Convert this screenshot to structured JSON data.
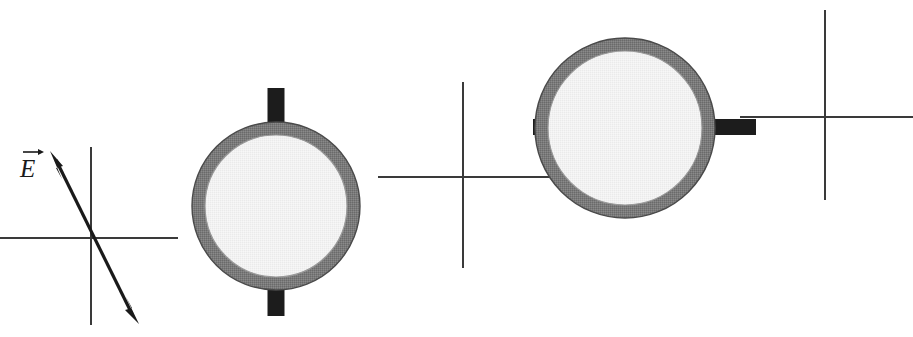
{
  "figure": {
    "width": 913,
    "height": 337,
    "background_color": "#ffffff"
  },
  "colors": {
    "axis_stroke": "#3a3a3a",
    "vector_stroke": "#1a1a1a",
    "ring_annulus": "#767676",
    "ring_inner_fill": "#f0f0f0",
    "tab_fill": "#1c1c1c",
    "label_color": "#1a1a1a"
  },
  "labels": {
    "e_field": "E",
    "e_field_full": "E vector"
  },
  "axes": [
    {
      "name": "left-axes",
      "origin_x": 91,
      "origin_y": 238,
      "x_start": 0,
      "x_end": 178,
      "y_start": 147,
      "y_end": 325,
      "has_vector": true
    },
    {
      "name": "middle-axes",
      "origin_x": 463,
      "origin_y": 177,
      "x_start": 378,
      "x_end": 556,
      "y_start": 82,
      "y_end": 268,
      "has_vector": false
    },
    {
      "name": "right-axes",
      "origin_x": 825,
      "origin_y": 117,
      "x_start": 740,
      "x_end": 913,
      "y_start": 10,
      "y_end": 200,
      "has_vector": false
    }
  ],
  "vector": {
    "name": "E-field vector",
    "label": "E",
    "tail_x": 137,
    "tail_y": 323,
    "tip_x": 50,
    "tip_y": 152,
    "double_headed": true,
    "label_x": 22,
    "label_y": 172
  },
  "rings": [
    {
      "name": "ring-1",
      "center_x": 276,
      "center_y": 206,
      "outer_radius": 84,
      "inner_radius": 71,
      "tab_orientation": "vertical",
      "tab_width": 17,
      "tab_length": 36
    },
    {
      "name": "ring-2",
      "center_x": 625,
      "center_y": 128,
      "outer_radius": 90,
      "inner_radius": 77,
      "tab_orientation": "horizontal",
      "tab_width": 15,
      "tab_length": 40
    }
  ]
}
